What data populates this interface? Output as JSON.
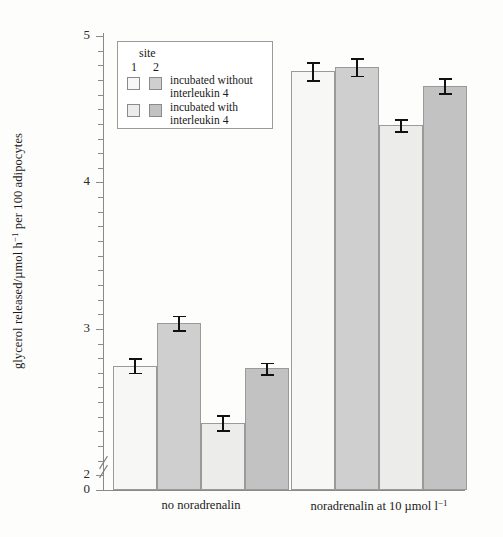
{
  "chart_data": {
    "type": "bar",
    "title": "",
    "xlabel": "",
    "ylabel": "glycerol released/µmol h⁻¹ per 100 adipocytes",
    "ylabel_parts": {
      "pre": "glycerol released/µmol h",
      "sup": "−1",
      "post": " per 100 adipocytes"
    },
    "ylim": [
      0,
      5
    ],
    "y_break": true,
    "y_break_between": [
      0,
      2
    ],
    "y_ticks": [
      0,
      2,
      3,
      4,
      5
    ],
    "y_tick_labels": [
      "0",
      "2",
      "3",
      "4",
      "5"
    ],
    "y_minor_tick_step": 0.1,
    "grid": false,
    "legend_position": "upper-left-inside",
    "categories": [
      "no noradrenalin",
      "noradrenalin at 10 µmol l⁻¹"
    ],
    "category_labels": [
      {
        "text": "no noradrenalin",
        "sup": ""
      },
      {
        "pre": "noradrenalin at 10 µmol l",
        "sup": "−1"
      }
    ],
    "series": [
      {
        "name": "site 1, incubated without interleukin 4",
        "site": 1,
        "condition": "incubated without interleukin 4",
        "color": "#f7f7f5",
        "values": [
          2.75,
          4.76
        ],
        "errors": [
          0.05,
          0.06
        ]
      },
      {
        "name": "site 2, incubated without interleukin 4",
        "site": 2,
        "condition": "incubated without interleukin 4",
        "color": "#cfcfcf",
        "values": [
          3.04,
          4.79
        ],
        "errors": [
          0.05,
          0.06
        ]
      },
      {
        "name": "site 1, incubated with interleukin 4",
        "site": 1,
        "condition": "incubated with interleukin 4",
        "color": "#ececea",
        "values": [
          2.36,
          4.39
        ],
        "errors": [
          0.05,
          0.04
        ]
      },
      {
        "name": "site 2, incubated with interleukin 4",
        "site": 2,
        "condition": "incubated with interleukin 4",
        "color": "#c2c2c2",
        "values": [
          2.73,
          4.66
        ],
        "errors": [
          0.04,
          0.05
        ]
      }
    ]
  },
  "legend": {
    "title": "site",
    "site_numbers": [
      "1",
      "2"
    ],
    "rows": [
      {
        "line1": "incubated without",
        "line2": "interleukin 4"
      },
      {
        "line1": "incubated with",
        "line2": "interleukin 4"
      }
    ]
  }
}
